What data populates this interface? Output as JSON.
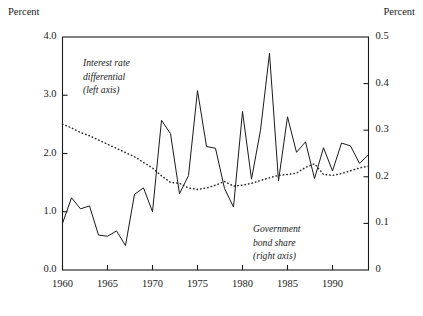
{
  "axes": {
    "left_unit_label": "Percent",
    "right_unit_label": "Percent",
    "left_ticks": [
      "4.0",
      "3.0",
      "2.0",
      "1.0",
      "0.0"
    ],
    "right_ticks": [
      "0.5",
      "0.4",
      "0.3",
      "0.2",
      "0.1",
      "0"
    ],
    "x_ticks": [
      "1960",
      "1965",
      "1970",
      "1975",
      "1980",
      "1985",
      "1990"
    ]
  },
  "annotations": {
    "left_series": [
      "Interest rate",
      "differential",
      "(left axis)"
    ],
    "right_series": [
      "Government",
      "bond share",
      "(right axis)"
    ]
  },
  "colors": {
    "ink": "#1a1a1a",
    "frame": "#1a1a1a",
    "background": "#ffffff"
  },
  "chart_data": {
    "type": "line",
    "title": "",
    "xlabel": "",
    "ylabel": "Percent",
    "y2label": "Percent",
    "grid": false,
    "legend": "inline-annotations",
    "xlim": [
      1960,
      1994
    ],
    "ylim": [
      0.0,
      4.0
    ],
    "y2lim": [
      0.0,
      0.5
    ],
    "x": [
      1960,
      1961,
      1962,
      1963,
      1964,
      1965,
      1966,
      1967,
      1968,
      1969,
      1970,
      1971,
      1972,
      1973,
      1974,
      1975,
      1976,
      1977,
      1978,
      1979,
      1980,
      1981,
      1982,
      1983,
      1984,
      1985,
      1986,
      1987,
      1988,
      1989,
      1990,
      1991,
      1992,
      1993,
      1994
    ],
    "series": [
      {
        "name": "Interest rate differential",
        "axis": "left",
        "style": "solid",
        "unit": "percent",
        "values": [
          0.8,
          1.24,
          1.05,
          1.1,
          0.6,
          0.58,
          0.67,
          0.42,
          1.3,
          1.41,
          1.0,
          2.57,
          2.34,
          1.31,
          1.62,
          3.08,
          2.12,
          2.09,
          1.4,
          1.08,
          2.72,
          1.56,
          2.4,
          3.72,
          1.53,
          2.63,
          2.02,
          2.2,
          1.57,
          2.1,
          1.7,
          2.18,
          2.13,
          1.83,
          1.98
        ]
      },
      {
        "name": "Government bond share",
        "axis": "right",
        "style": "dotted",
        "unit": "share",
        "values": [
          0.313,
          0.305,
          0.295,
          0.288,
          0.279,
          0.27,
          0.261,
          0.252,
          0.243,
          0.231,
          0.219,
          0.202,
          0.188,
          0.186,
          0.176,
          0.173,
          0.176,
          0.182,
          0.19,
          0.18,
          0.182,
          0.186,
          0.192,
          0.198,
          0.203,
          0.205,
          0.208,
          0.22,
          0.228,
          0.205,
          0.203,
          0.207,
          0.213,
          0.219,
          0.223
        ]
      }
    ]
  }
}
